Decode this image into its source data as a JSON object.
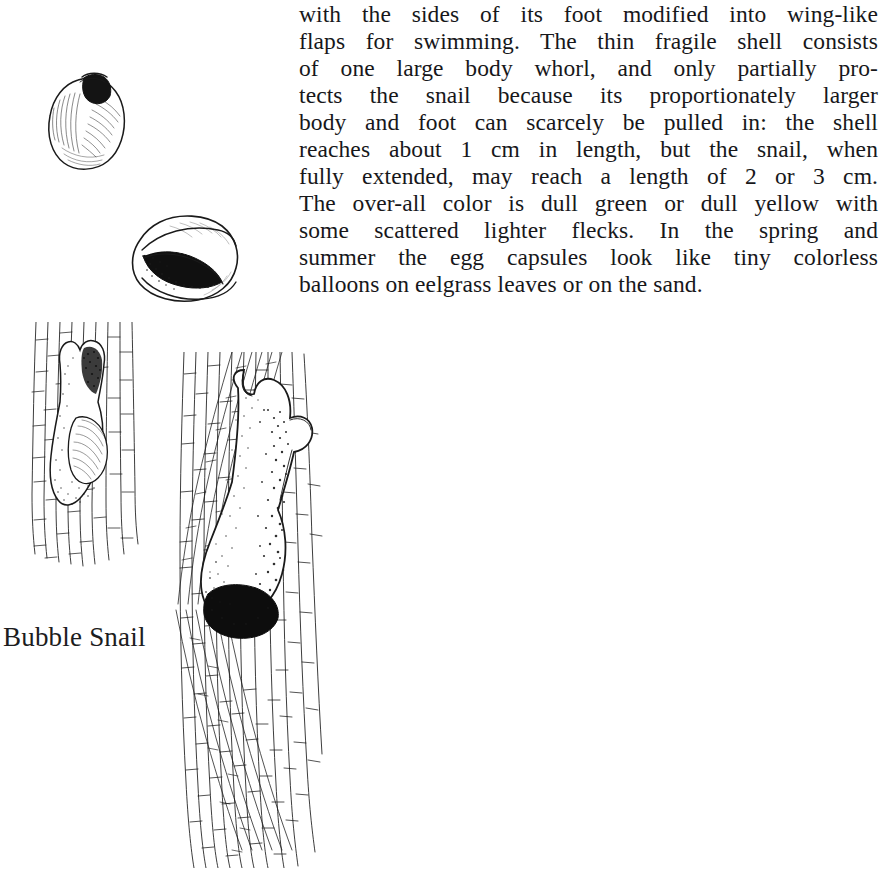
{
  "page": {
    "background_color": "#ffffff",
    "ink_color": "#1a1a1a",
    "width": 887,
    "height": 869
  },
  "body_text": {
    "full_paragraph": "with the sides of its foot modified into wing-like flaps for swimming. The thin fragile shell consists of one large body whorl, and only partially protects the snail because its proportionately larger body and foot can scarcely be pulled in: the shell reaches about 1 cm in length, but the snail, when fully extended, may reach a length of 2 or 3 cm. The over-all color is dull green or dull yellow with some scattered lighter flecks. In the spring and summer the egg capsules look like tiny colorless balloons on eelgrass leaves or on the sand.",
    "lines": [
      "with the sides of its foot modified into wing-like",
      "flaps for swimming. The thin fragile shell consists",
      "of one large body whorl, and only partially pro-",
      "tects the snail because its proportionately larger",
      "body and foot can scarcely be pulled in: the shell",
      "reaches about 1 cm in length, but the snail, when",
      "fully extended, may reach a length of 2 or 3 cm.",
      "The over-all color is dull green or dull yellow with",
      "some scattered lighter flecks. In the spring and",
      "summer the egg capsules look like tiny colorless",
      "balloons on eelgrass leaves or on the sand."
    ]
  },
  "caption": {
    "label": "Bubble Snail"
  },
  "figures": [
    {
      "id": "shell-dorsal",
      "name": "bubble-snail-shell-dorsal-view",
      "description": "Oval thin shell with dark sunken apex at top, fine hatched shading"
    },
    {
      "id": "shell-aperture",
      "name": "bubble-snail-shell-aperture-view",
      "description": "Shell tilted showing long dark aperture slit of the single body whorl"
    },
    {
      "id": "snail-on-blade-small",
      "name": "bubble-snail-on-eelgrass-blade-small",
      "description": "Snail with wing-like foot flaps crawling on a segmented eelgrass blade"
    },
    {
      "id": "snail-on-blade-large",
      "name": "bubble-snail-on-eelgrass-blades-large",
      "description": "Large snail, fully extended, on crossing eelgrass blades; dark shell visible at rear"
    }
  ]
}
